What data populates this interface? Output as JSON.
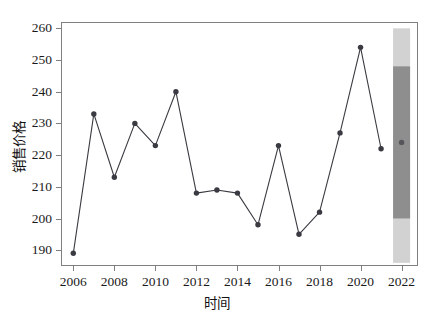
{
  "chart_data": {
    "type": "line",
    "title": "",
    "subtitle": "",
    "xlabel": "时间",
    "ylabel": "销售价格",
    "grid": false,
    "legend": null,
    "xlim": [
      2005.4,
      2022.8
    ],
    "ylim": [
      185.0,
      262.0
    ],
    "xticks": [
      2006,
      2008,
      2010,
      2012,
      2014,
      2016,
      2018,
      2020,
      2022
    ],
    "xtick_labels": [
      "2006",
      "2008",
      "2010",
      "2012",
      "2014",
      "2016",
      "2018",
      "2020",
      "2022"
    ],
    "yticks": [
      190,
      200,
      210,
      220,
      230,
      240,
      250,
      260
    ],
    "ytick_labels": [
      "190",
      "200",
      "210",
      "220",
      "230",
      "240",
      "250",
      "260"
    ],
    "x": [
      2006,
      2007,
      2008,
      2009,
      2010,
      2011,
      2012,
      2013,
      2014,
      2015,
      2016,
      2017,
      2018,
      2019,
      2020,
      2021
    ],
    "series": [
      {
        "name": "销售价格",
        "color": "#3a3a42",
        "marker": "circle",
        "values": [
          189,
          233,
          213,
          230,
          223,
          240,
          208,
          209,
          208,
          198,
          223,
          195,
          202,
          227,
          254,
          222
        ]
      }
    ],
    "forecast": {
      "x": 2022,
      "point": 224,
      "inner_interval": [
        200,
        248
      ],
      "outer_interval": [
        186,
        260
      ],
      "inner_color": "#8e8e8e",
      "outer_color": "#d2d2d2",
      "point_color": "#55555c"
    },
    "annotations": []
  }
}
